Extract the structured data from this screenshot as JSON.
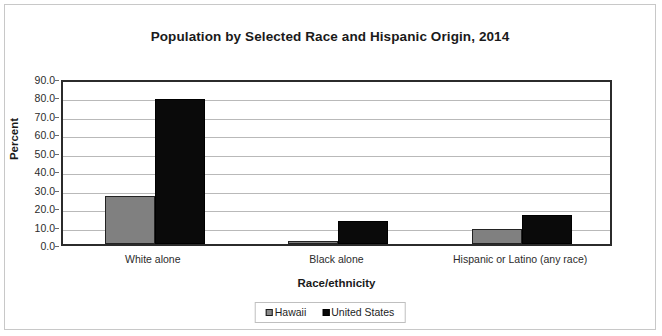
{
  "chart_data": {
    "type": "bar",
    "title": "Population by Selected Race and Hispanic Origin, 2014",
    "xlabel": "Race/ethnicity",
    "ylabel": "Percent",
    "categories": [
      "White alone",
      "Black alone",
      "Hispanic or Latino (any race)"
    ],
    "series": [
      {
        "name": "Hawaii",
        "color": "#808080",
        "values": [
          25.9,
          1.6,
          8.3
        ]
      },
      {
        "name": "United States",
        "color": "#0a0a0a",
        "values": [
          78.5,
          12.6,
          15.8
        ]
      }
    ],
    "ylim": [
      0.0,
      90.0
    ],
    "ytick_labels": [
      "90.0",
      "80.0",
      "70.0",
      "60.0",
      "50.0",
      "40.0",
      "30.0",
      "20.0",
      "10.0",
      "0.0"
    ],
    "ytick_values": [
      90.0,
      80.0,
      70.0,
      60.0,
      50.0,
      40.0,
      30.0,
      20.0,
      10.0,
      0.0
    ],
    "grid": true,
    "legend_position": "bottom",
    "legend_entries": [
      "Hawaii",
      "United States"
    ]
  }
}
